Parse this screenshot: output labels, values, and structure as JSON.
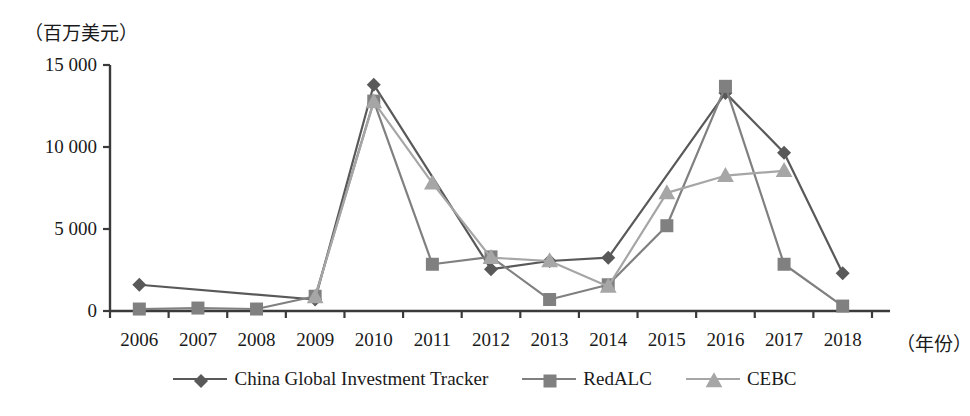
{
  "chart_data": {
    "type": "line",
    "title": "",
    "ylabel": "（百万美元）",
    "xlabel": "（年份）",
    "categories": [
      "2006",
      "2007",
      "2008",
      "2009",
      "2010",
      "2011",
      "2012",
      "2013",
      "2014",
      "2015",
      "2016",
      "2017",
      "2018"
    ],
    "yticks": [
      "0",
      "5 000",
      "10 000",
      "15 000"
    ],
    "ytick_values": [
      0,
      5000,
      10000,
      15000
    ],
    "ylim": [
      0,
      15000
    ],
    "grid": false,
    "legend_position": "bottom",
    "series": [
      {
        "name": "China Global Investment Tracker",
        "marker": "diamond",
        "color": "#595959",
        "values": [
          1600,
          null,
          null,
          700,
          13800,
          null,
          2550,
          3050,
          3250,
          null,
          13300,
          9650,
          2300
        ]
      },
      {
        "name": "RedALC",
        "marker": "square",
        "color": "#808080",
        "values": [
          120,
          180,
          120,
          900,
          12800,
          2850,
          3300,
          700,
          1600,
          5200,
          13700,
          2850,
          300
        ]
      },
      {
        "name": "CEBC",
        "marker": "triangle",
        "color": "#a6a6a6",
        "values": [
          null,
          null,
          null,
          850,
          12750,
          7800,
          3250,
          3050,
          1500,
          7200,
          8250,
          8550,
          null
        ]
      }
    ]
  },
  "legend": {
    "items": [
      {
        "label": "China Global Investment Tracker",
        "marker": "diamond",
        "color": "#595959"
      },
      {
        "label": "RedALC",
        "marker": "square",
        "color": "#808080"
      },
      {
        "label": "CEBC",
        "marker": "triangle",
        "color": "#a6a6a6"
      }
    ]
  },
  "axes": {
    "y_unit_label": "（百万美元）",
    "x_unit_label": "（年份）"
  }
}
